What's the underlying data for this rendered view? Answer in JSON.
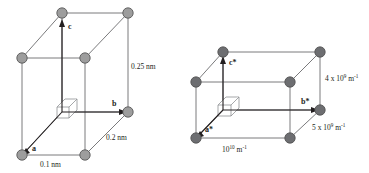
{
  "figure": {
    "background_color": "#ffffff",
    "node_color": "#9d9d9d",
    "node_color_reciprocal": "#6d6e71",
    "edge_color": "#58585a",
    "axis_color": "#231f20"
  },
  "direct_cell": {
    "name": "direct-lattice-cell",
    "vectors": [
      {
        "id": "a",
        "label": "a"
      },
      {
        "id": "b",
        "label": "b"
      },
      {
        "id": "c",
        "label": "c"
      }
    ],
    "dimensions": [
      {
        "id": "edge-a",
        "label": "0.1 nm",
        "value": 0.1,
        "unit": "nm"
      },
      {
        "id": "edge-b",
        "label": "0.2 nm",
        "value": 0.2,
        "unit": "nm"
      },
      {
        "id": "edge-c",
        "label": "0.25 nm",
        "value": 0.25,
        "unit": "nm"
      }
    ]
  },
  "reciprocal_cell": {
    "name": "reciprocal-lattice-cell",
    "vectors": [
      {
        "id": "a-star",
        "label": "a*"
      },
      {
        "id": "b-star",
        "label": "b*"
      },
      {
        "id": "c-star",
        "label": "c*"
      }
    ],
    "dimensions": [
      {
        "id": "edge-a-star",
        "mantissa": "10",
        "exponent": "10",
        "unit_base": " m",
        "unit_exponent": "-1",
        "label": "10^10 m^-1"
      },
      {
        "id": "edge-b-star",
        "mantissa": "5 x 10",
        "exponent": "9",
        "unit_base": " m",
        "unit_exponent": "-1",
        "label": "5 x 10^9 m^-1"
      },
      {
        "id": "edge-c-star",
        "mantissa": "4 x 10",
        "exponent": "9",
        "unit_base": " m",
        "unit_exponent": "-1",
        "label": "4 x 10^9 m^-1"
      }
    ]
  }
}
